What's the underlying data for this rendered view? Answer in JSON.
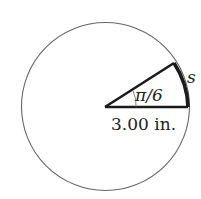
{
  "diagram": {
    "type": "circle-sector",
    "angle_label": "π/6",
    "radius_label": "3.00 in.",
    "arc_label": "s",
    "colors": {
      "circle": "#666666",
      "sector": "#1a1a1a",
      "text": "#222222"
    }
  }
}
